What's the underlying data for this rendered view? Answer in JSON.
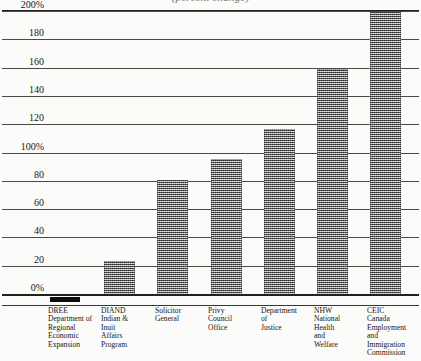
{
  "chart_data": {
    "type": "bar",
    "title": "",
    "xlabel": "",
    "ylabel": "",
    "ylim": [
      0,
      200
    ],
    "grid": true,
    "legend": "none",
    "units": "percent",
    "categories": [
      "DREE Department of Regional Economic Expansion",
      "DIAND Indian & Inuit Affairs Program",
      "Solicitor General",
      "Privy Council Office",
      "Department of Justice",
      "NHW National Health and Welfare",
      "CEIC Canada Employment and Immigration Commission"
    ],
    "values": [
      -5,
      24,
      81,
      96,
      117,
      160,
      200
    ],
    "tick_labels": [
      "0%",
      "20",
      "40",
      "60",
      "80",
      "100%",
      "120",
      "140",
      "160",
      "180",
      "200%"
    ],
    "tick_values": [
      0,
      20,
      40,
      60,
      80,
      100,
      120,
      140,
      160,
      180,
      200
    ]
  },
  "axis": {
    "y_ticks": [
      {
        "label": "200%",
        "value": 200
      },
      {
        "label": "180",
        "value": 180
      },
      {
        "label": "160",
        "value": 160
      },
      {
        "label": "140",
        "value": 140
      },
      {
        "label": "120",
        "value": 120
      },
      {
        "label": "100%",
        "value": 100
      },
      {
        "label": "80",
        "value": 80
      },
      {
        "label": "60",
        "value": 60
      },
      {
        "label": "40",
        "value": 40
      },
      {
        "label": "20",
        "value": 20
      },
      {
        "label": "0%",
        "value": 0
      }
    ]
  },
  "bars": [
    {
      "key": "dree",
      "value": -5,
      "style": "solid",
      "left": 50,
      "width": 30
    },
    {
      "key": "diand",
      "value": 24,
      "style": "hatch",
      "left": 104,
      "width": 31
    },
    {
      "key": "solicitor",
      "value": 81,
      "style": "hatch",
      "left": 157,
      "width": 31
    },
    {
      "key": "privy",
      "value": 96,
      "style": "hatch",
      "left": 211,
      "width": 31
    },
    {
      "key": "justice",
      "value": 117,
      "style": "hatch",
      "left": 264,
      "width": 31
    },
    {
      "key": "nhw",
      "value": 160,
      "style": "hatch",
      "left": 317,
      "width": 31
    },
    {
      "key": "ceic",
      "value": 200,
      "style": "hatch",
      "left": 370,
      "width": 31
    }
  ],
  "x_labels": [
    {
      "key": "dree",
      "left": 48,
      "lines": [
        "DREE",
        "Department of",
        "Regional",
        "Economic",
        "Expansion"
      ]
    },
    {
      "key": "diand",
      "left": 101,
      "lines": [
        "DIAND",
        "Indian &",
        "Inuit",
        "Affairs",
        "Program"
      ]
    },
    {
      "key": "solicitor",
      "left": 155,
      "lines": [
        "Solicitor",
        "General"
      ]
    },
    {
      "key": "privy",
      "left": 208,
      "lines": [
        "Privy",
        "Council",
        "Office"
      ]
    },
    {
      "key": "justice",
      "left": 261,
      "lines": [
        "Department",
        "of",
        "Justice"
      ]
    },
    {
      "key": "nhw",
      "left": 314,
      "lines": [
        "NHW",
        "National",
        "Health",
        "and",
        "Welfare"
      ]
    },
    {
      "key": "ceic",
      "left": 367,
      "lines": [
        "CEIC",
        "Canada",
        "Employment",
        "and",
        "Immigration",
        "Commission"
      ]
    }
  ],
  "title": {
    "clipped_text": "(percent change)"
  },
  "colors": {
    "ink": "#1a1a1a",
    "rule": "#23211f",
    "grid": "#4b4845",
    "bar_fill": "#9c9c9c",
    "bar_solid": "#0d0c0b",
    "background": "#fbfbfa"
  }
}
